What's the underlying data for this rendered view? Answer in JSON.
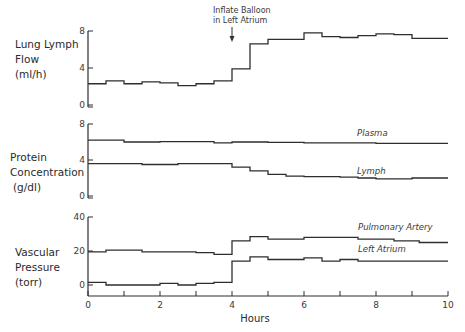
{
  "chart_data": [
    {
      "type": "line",
      "step": true,
      "title": "",
      "ylabel_lines": [
        "Lung Lymph",
        "Flow",
        "(ml/h)"
      ],
      "xlabel": "",
      "ylim": [
        0,
        8
      ],
      "yticks": [
        "0",
        "4",
        "8"
      ],
      "x": [
        0,
        0.5,
        1,
        1.5,
        2,
        2.5,
        3,
        3.5,
        4,
        4.5,
        5,
        6,
        6.5,
        7,
        7.5,
        8,
        8.5,
        9,
        10
      ],
      "series": [
        {
          "name": "Lung Lymph Flow",
          "values": [
            2.3,
            2.6,
            2.3,
            2.5,
            2.4,
            2.1,
            2.3,
            2.6,
            3.9,
            6.6,
            7.1,
            7.8,
            7.4,
            7.3,
            7.5,
            7.7,
            7.6,
            7.2,
            7.2
          ]
        }
      ],
      "annotations": [
        {
          "text_lines": [
            "Inflate Balloon",
            "in Left Atrium"
          ],
          "x": 4,
          "arrow": "down"
        }
      ]
    },
    {
      "type": "line",
      "step": true,
      "title": "",
      "ylabel_lines": [
        "Protein",
        "Concentration",
        "(g/dl)"
      ],
      "xlabel": "",
      "ylim": [
        0,
        8
      ],
      "yticks": [
        "0",
        "4",
        "8"
      ],
      "x": [
        0,
        0.5,
        1,
        1.5,
        2,
        2.5,
        3,
        3.5,
        4,
        4.5,
        5,
        5.5,
        6,
        6.5,
        7,
        7.5,
        8,
        8.5,
        9,
        10
      ],
      "series": [
        {
          "name": "Plasma",
          "values": [
            6.2,
            6.2,
            6.0,
            6.0,
            6.05,
            6.05,
            6.05,
            5.9,
            6.0,
            6.0,
            5.95,
            5.95,
            5.9,
            5.9,
            5.9,
            5.9,
            5.85,
            5.85,
            5.85,
            5.85
          ]
        },
        {
          "name": "Lymph",
          "values": [
            3.6,
            3.6,
            3.6,
            3.5,
            3.5,
            3.6,
            3.6,
            3.6,
            3.2,
            2.8,
            2.4,
            2.2,
            2.15,
            2.15,
            2.1,
            2.0,
            1.9,
            1.9,
            2.0,
            2.0
          ]
        }
      ]
    },
    {
      "type": "line",
      "step": true,
      "title": "",
      "ylabel_lines": [
        "Vascular",
        "Pressure",
        "(torr)"
      ],
      "xlabel": "Hours",
      "ylim": [
        0,
        40
      ],
      "yticks": [
        "0",
        "20",
        "40"
      ],
      "xticks": [
        "0",
        "2",
        "4",
        "6",
        "8",
        "10"
      ],
      "xlim": [
        0,
        10
      ],
      "x": [
        0,
        0.5,
        1,
        1.5,
        2,
        2.5,
        3,
        3.5,
        4,
        4.5,
        5,
        6,
        6.5,
        7,
        7.5,
        8,
        8.5,
        9,
        9.2,
        10
      ],
      "series": [
        {
          "name": "Pulmonary Artery",
          "values": [
            19.5,
            20.5,
            20.5,
            19.5,
            19.5,
            19.5,
            19,
            18,
            26,
            28.5,
            27,
            28,
            28,
            28,
            27,
            27,
            26,
            26,
            25,
            25
          ]
        },
        {
          "name": "Left Atrium",
          "values": [
            1.5,
            0,
            0,
            0,
            1,
            0,
            1,
            1.5,
            14,
            16.5,
            15,
            16,
            14,
            15,
            14,
            14,
            14,
            14,
            14,
            14
          ]
        }
      ]
    }
  ],
  "labels": {
    "panel1_ylabel": [
      "Lung Lymph",
      "Flow",
      "(ml/h)"
    ],
    "panel2_ylabel": [
      "Protein",
      "Concentration",
      "(g/dl)"
    ],
    "panel3_ylabel": [
      "Vascular",
      "Pressure",
      "(torr)"
    ],
    "annotation": [
      "Inflate Balloon",
      "in Left Atrium"
    ],
    "plasma": "Plasma",
    "lymph": "Lymph",
    "pulmonary_artery": "Pulmonary Artery",
    "left_atrium": "Left Atrium",
    "xlabel": "Hours"
  },
  "colors": {
    "ink": "#2e2e2e",
    "background": "#ffffff"
  }
}
